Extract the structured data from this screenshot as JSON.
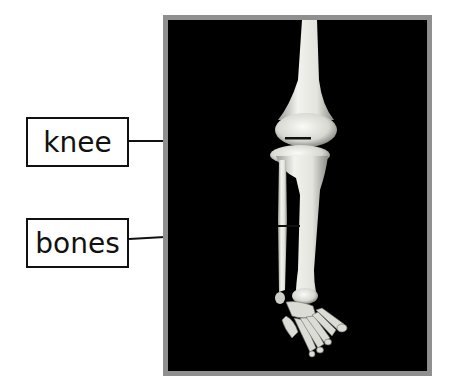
{
  "diagram": {
    "photo": {
      "subject": "human leg skeleton (femur, knee, tibia, fibula, foot bones)",
      "background_color": "#000000",
      "frame_color": "#8f8f8f",
      "bone_color": "#e8e8e2"
    },
    "labels": [
      {
        "text": "knee",
        "target": "knee joint"
      },
      {
        "text": "bones",
        "target": "tibia and fibula"
      }
    ],
    "line_color": "#111111"
  }
}
